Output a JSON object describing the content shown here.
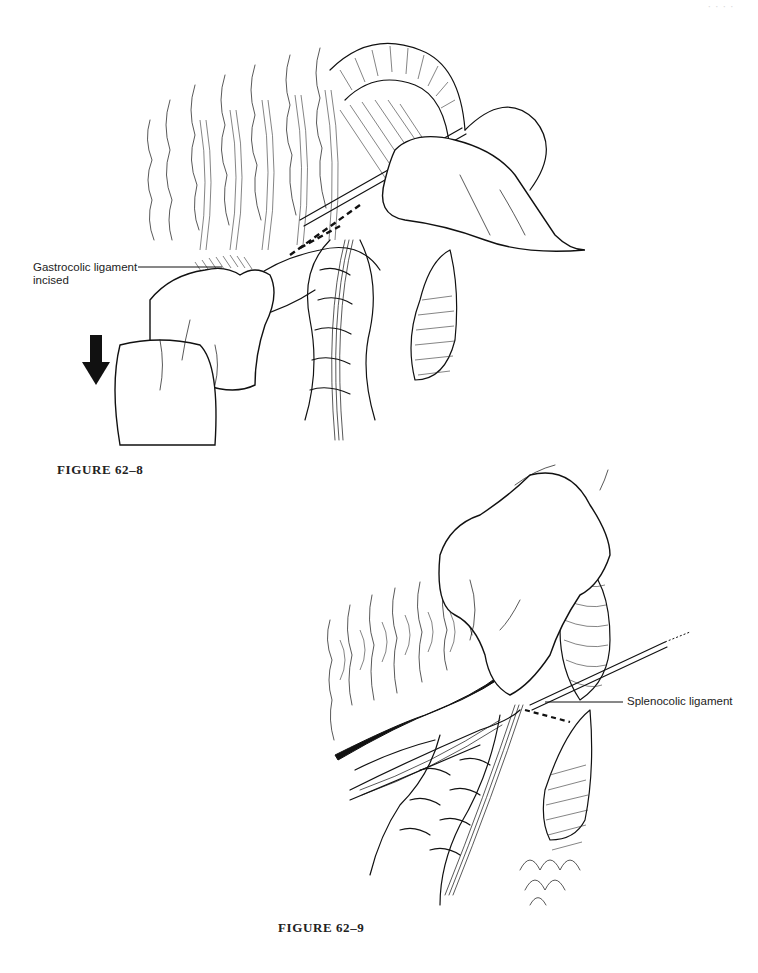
{
  "page": {
    "running_head": "· · · ·"
  },
  "figures": [
    {
      "id": "figure-62-8",
      "caption": "FIGURE 62–8",
      "labels": [
        {
          "text_line1": "Gastrocolic ligament",
          "text_line2": "incised"
        }
      ],
      "arrow_direction": "down",
      "elements": [
        "omentum",
        "transverse-colon",
        "surgeon-hand-with-cautery",
        "assistant-hand-retracting",
        "stomach",
        "cut-line-dashed"
      ]
    },
    {
      "id": "figure-62-9",
      "caption": "FIGURE 62–9",
      "labels": [
        {
          "text_line1": "Splenocolic ligament"
        }
      ],
      "elements": [
        "omentum",
        "splenic-flexure-colon",
        "surgeon-hand",
        "probe-instrument",
        "spleen",
        "cut-line-dashed",
        "incised-edge-dark"
      ]
    }
  ],
  "colors": {
    "background": "#ffffff",
    "ink": "#111111",
    "label_text": "#222222"
  }
}
